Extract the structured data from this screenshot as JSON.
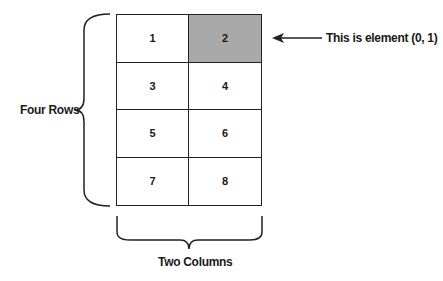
{
  "diagram": {
    "cells": [
      {
        "label": "1",
        "row": 0,
        "col": 0,
        "highlighted": false
      },
      {
        "label": "2",
        "row": 0,
        "col": 1,
        "highlighted": true
      },
      {
        "label": "3",
        "row": 1,
        "col": 0,
        "highlighted": false
      },
      {
        "label": "4",
        "row": 1,
        "col": 1,
        "highlighted": false
      },
      {
        "label": "5",
        "row": 2,
        "col": 0,
        "highlighted": false
      },
      {
        "label": "6",
        "row": 2,
        "col": 1,
        "highlighted": false
      },
      {
        "label": "7",
        "row": 3,
        "col": 0,
        "highlighted": false
      },
      {
        "label": "8",
        "row": 3,
        "col": 1,
        "highlighted": false
      }
    ],
    "rows_label": "Four Rows",
    "columns_label": "Two Columns",
    "pointer_label": "This is element (0, 1)",
    "highlight_color": "#a9a9a9"
  }
}
